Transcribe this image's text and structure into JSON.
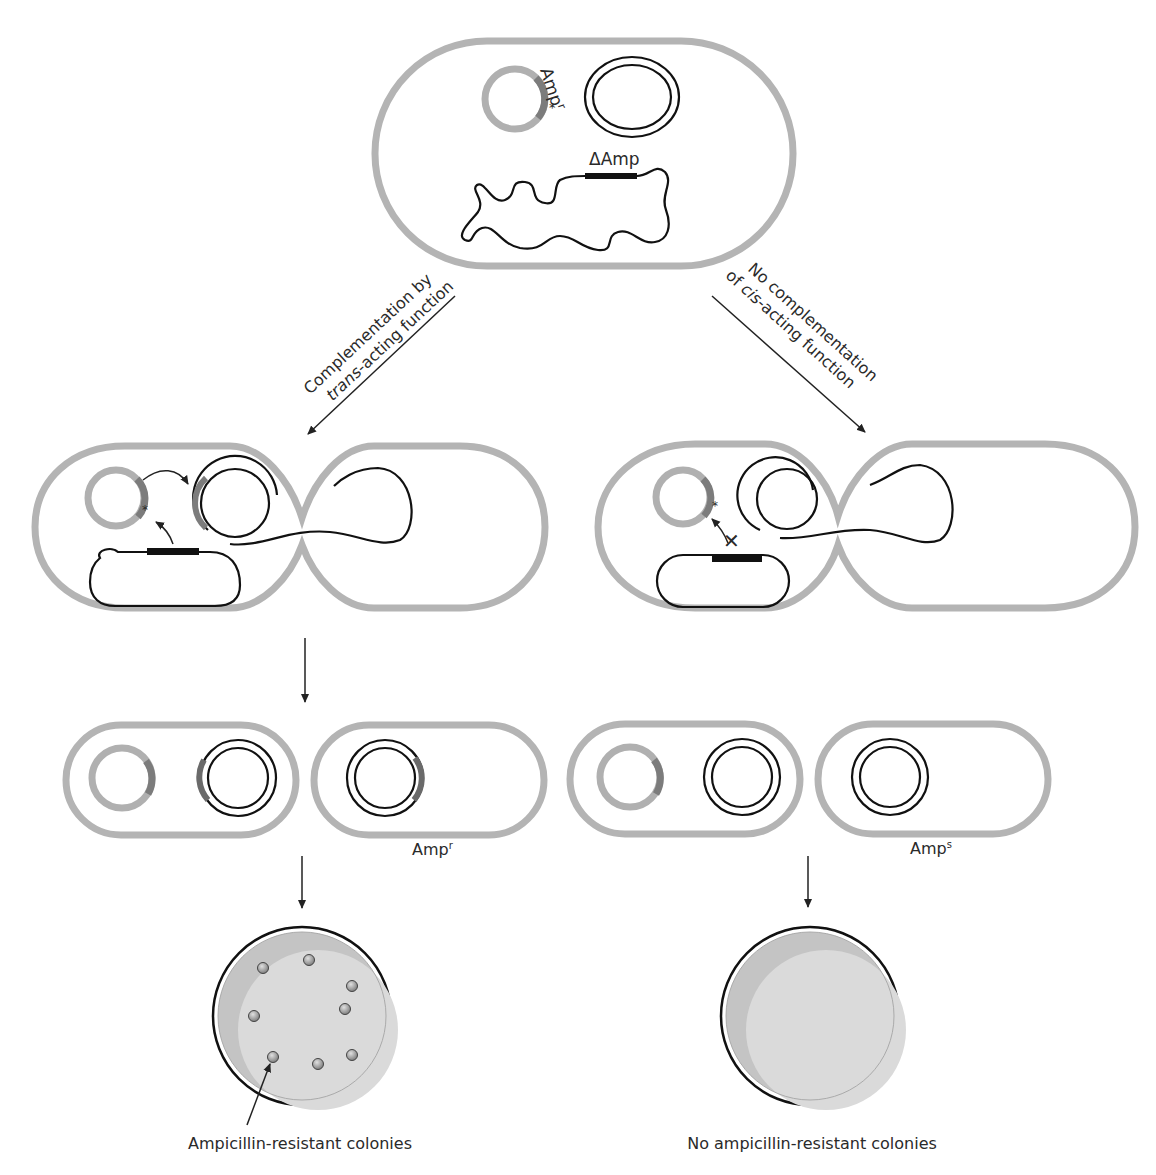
{
  "figure": {
    "top_cell": {
      "plasmid_label": "Amp",
      "plasmid_label_sup": "r",
      "mutation_marker": "*",
      "chromosome_label": "ΔAmp"
    },
    "pathways": {
      "left": {
        "line1": "Complementation by",
        "line2_italic": "trans",
        "line2_rest": "-acting function"
      },
      "right": {
        "line1": "No complementation",
        "line2_prefix": "of ",
        "line2_italic": "cis",
        "line2_rest": "-acting function"
      }
    },
    "daughter_labels": {
      "left": {
        "base": "Amp",
        "sup": "r"
      },
      "right": {
        "base": "Amp",
        "sup": "s"
      }
    },
    "plates": {
      "left": {
        "caption": "Ampicillin-resistant colonies",
        "colony_count": 8
      },
      "right": {
        "caption": "No ampicillin-resistant colonies",
        "colony_count": 0
      }
    },
    "markers": {
      "star": "*",
      "block": "✕"
    },
    "colors": {
      "cell_wall": "#b4b4b4",
      "amp_segment": "#7c7c7c",
      "dna": "#111111",
      "plate_fill": "#d9d9d9",
      "plate_shade": "#c4c4c4",
      "colony": "#9a9a9a"
    }
  }
}
